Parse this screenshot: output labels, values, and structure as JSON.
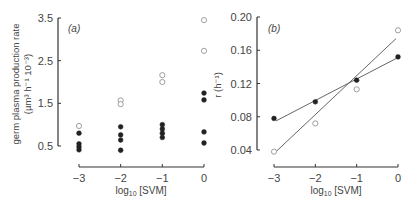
{
  "chart_data": [
    {
      "panel": "(a)",
      "type": "scatter",
      "xlabel": "log10 [SVM]",
      "ylabel": "germ plasma production rate",
      "ylabel_units": "(µm³ h⁻¹ 10⁻³)",
      "xticks": [
        -3,
        -2,
        -1,
        0
      ],
      "xtick_labels": [
        "−3",
        "−2",
        "−1",
        "0"
      ],
      "yticks": [
        0.5,
        1.5,
        2.5,
        3.5
      ],
      "ytick_labels": [
        "0.5",
        "1.5",
        "2.5",
        "3.5"
      ],
      "xlim": [
        -3,
        0
      ],
      "ylim": [
        0.5,
        3.5
      ],
      "grid": false,
      "legend": null,
      "series": [
        {
          "name": "open circles",
          "marker": "open-circle",
          "points": [
            {
              "x": -3,
              "y": 0.97
            },
            {
              "x": -2,
              "y": 1.57
            },
            {
              "x": -2,
              "y": 1.48
            },
            {
              "x": -1,
              "y": 2.16
            },
            {
              "x": -1,
              "y": 2.0
            },
            {
              "x": 0,
              "y": 3.45
            },
            {
              "x": 0,
              "y": 2.73
            }
          ]
        },
        {
          "name": "filled circles",
          "marker": "filled-circle",
          "points": [
            {
              "x": -3,
              "y": 0.8
            },
            {
              "x": -3,
              "y": 0.55
            },
            {
              "x": -3,
              "y": 0.48
            },
            {
              "x": -3,
              "y": 0.41
            },
            {
              "x": -2,
              "y": 0.95
            },
            {
              "x": -2,
              "y": 0.76
            },
            {
              "x": -2,
              "y": 0.64
            },
            {
              "x": -2,
              "y": 0.4
            },
            {
              "x": -1,
              "y": 1.0
            },
            {
              "x": -1,
              "y": 0.9
            },
            {
              "x": -1,
              "y": 0.8
            },
            {
              "x": -1,
              "y": 0.7
            },
            {
              "x": 0,
              "y": 1.74
            },
            {
              "x": 0,
              "y": 1.58
            },
            {
              "x": 0,
              "y": 0.83
            },
            {
              "x": 0,
              "y": 0.57
            }
          ]
        }
      ]
    },
    {
      "panel": "(b)",
      "type": "line",
      "xlabel": "log10 [SVM]",
      "ylabel": "r (h⁻¹)",
      "xticks": [
        -3,
        -2,
        -1,
        0
      ],
      "xtick_labels": [
        "−3",
        "−2",
        "−1",
        "0"
      ],
      "yticks": [
        0.04,
        0.08,
        0.12,
        0.16,
        0.2
      ],
      "ytick_labels": [
        "0.04",
        "0.08",
        "0.12",
        "0.16",
        "0.20"
      ],
      "xlim": [
        -3,
        0
      ],
      "ylim": [
        0.04,
        0.2
      ],
      "grid": false,
      "legend": null,
      "series": [
        {
          "name": "filled circles",
          "marker": "filled-circle",
          "points": [
            {
              "x": -3,
              "y": 0.078
            },
            {
              "x": -2,
              "y": 0.098
            },
            {
              "x": -1,
              "y": 0.124
            },
            {
              "x": 0,
              "y": 0.152
            }
          ],
          "fit_line": [
            {
              "x": -3,
              "y": 0.075
            },
            {
              "x": 0,
              "y": 0.15
            }
          ]
        },
        {
          "name": "open circles",
          "marker": "open-circle",
          "points": [
            {
              "x": -3,
              "y": 0.038
            },
            {
              "x": -2,
              "y": 0.072
            },
            {
              "x": -1,
              "y": 0.113
            },
            {
              "x": 0,
              "y": 0.184
            }
          ],
          "fit_line": [
            {
              "x": -3,
              "y": 0.038
            },
            {
              "x": 0,
              "y": 0.174
            }
          ]
        }
      ]
    }
  ],
  "labels": {
    "panel_a": "(a)",
    "panel_b": "(b)",
    "xlabel_prefix": "log",
    "xlabel_sub": "10",
    "xlabel_suffix": " [SVM]",
    "a_ylabel_line1": "germ plasma production rate",
    "a_ylabel_line2": "(µm³ h⁻¹ 10⁻³)",
    "b_ylabel": "r (h⁻¹)"
  }
}
